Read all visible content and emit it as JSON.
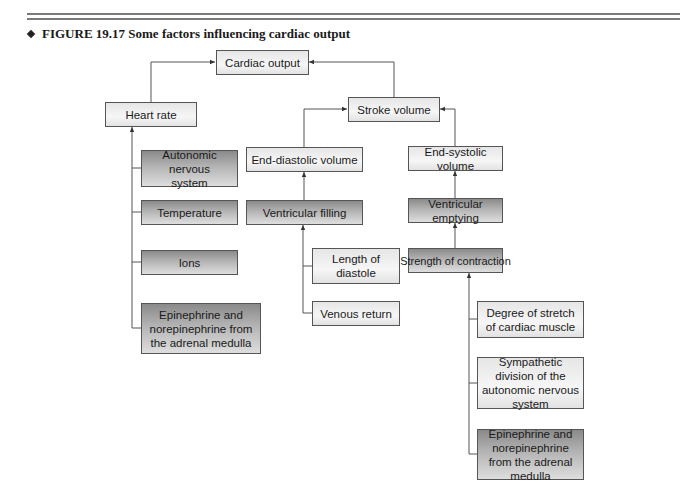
{
  "figure": {
    "title": "FIGURE 19.17  Some factors influencing cardiac output"
  },
  "nodes": {
    "cardiac_output": "Cardiac output",
    "heart_rate": "Heart rate",
    "stroke_volume": "Stroke volume",
    "autonomic_ns": "Autonomic nervous system",
    "temperature": "Temperature",
    "ions": "Ions",
    "epinephrine_left": "Epinephrine and norepinephrine from the adrenal medulla",
    "end_diastolic": "End-diastolic volume",
    "ventricular_filling": "Ventricular filling",
    "length_diastole": "Length of diastole",
    "venous_return": "Venous return",
    "end_systolic": "End-systolic volume",
    "ventricular_emptying": "Ventricular emptying",
    "strength_contraction": "Strength of contraction",
    "degree_stretch": "Degree of stretch of cardiac muscle",
    "sympathetic": "Sympathetic division of the autonomic nervous system",
    "epinephrine_right": "Epinephrine and norepinephrine from the adrenal medulla"
  },
  "edges": [
    [
      "heart_rate",
      "cardiac_output"
    ],
    [
      "stroke_volume",
      "cardiac_output"
    ],
    [
      "end_diastolic",
      "stroke_volume"
    ],
    [
      "end_systolic",
      "stroke_volume"
    ],
    [
      "autonomic_ns",
      "heart_rate"
    ],
    [
      "temperature",
      "heart_rate"
    ],
    [
      "ions",
      "heart_rate"
    ],
    [
      "epinephrine_left",
      "heart_rate"
    ],
    [
      "ventricular_filling",
      "end_diastolic"
    ],
    [
      "length_diastole",
      "ventricular_filling"
    ],
    [
      "venous_return",
      "ventricular_filling"
    ],
    [
      "ventricular_emptying",
      "end_systolic"
    ],
    [
      "strength_contraction",
      "ventricular_emptying"
    ],
    [
      "degree_stretch",
      "strength_contraction"
    ],
    [
      "sympathetic",
      "strength_contraction"
    ],
    [
      "epinephrine_right",
      "strength_contraction"
    ]
  ],
  "colors": {
    "rule": "#7a7a7a",
    "line": "#555555",
    "box_light": "#eeeeee",
    "box_dark": "#9a9a9a"
  }
}
